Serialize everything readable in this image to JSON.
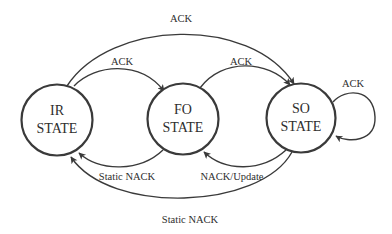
{
  "diagram": {
    "type": "state-machine",
    "colors": {
      "stroke": "#3a3a3a",
      "text": "#2e2e2e",
      "background": "#ffffff"
    },
    "states": [
      {
        "id": "IR",
        "line1": "IR",
        "line2": "STATE"
      },
      {
        "id": "FO",
        "line1": "FO",
        "line2": "STATE"
      },
      {
        "id": "SO",
        "line1": "SO",
        "line2": "STATE"
      }
    ],
    "transitions": [
      {
        "from": "IR",
        "to": "SO",
        "label": "ACK"
      },
      {
        "from": "IR",
        "to": "FO",
        "label": "ACK"
      },
      {
        "from": "FO",
        "to": "SO",
        "label": "ACK"
      },
      {
        "from": "SO",
        "to": "SO",
        "label": "ACK"
      },
      {
        "from": "FO",
        "to": "IR",
        "label": "Static NACK"
      },
      {
        "from": "SO",
        "to": "FO",
        "label": "NACK/Update"
      },
      {
        "from": "SO",
        "to": "IR",
        "label": "Static NACK"
      }
    ]
  }
}
